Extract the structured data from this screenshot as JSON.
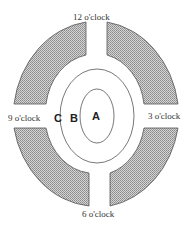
{
  "diagram": {
    "clock_labels": {
      "top": "12 o'clock",
      "right": "3 o'clock",
      "bottom": "6 o'clock",
      "left": "9 o'clock"
    },
    "zones": {
      "inner": "A",
      "middle": "B",
      "outer": "C"
    },
    "colors": {
      "segment_fill": "#b8b8b8",
      "stroke": "#555555"
    }
  }
}
